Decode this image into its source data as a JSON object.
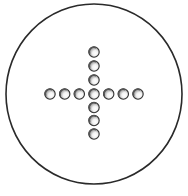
{
  "figure": {
    "description": "Circular field containing a cross of beads",
    "outline": {
      "cx": 94,
      "cy": 94,
      "rx": 88,
      "ry": 90,
      "stroke": "#2a2a2a",
      "stroke_width": 1.6
    },
    "bead_style": {
      "r": 5.2,
      "stroke": "#333333",
      "fill": "#ffffff",
      "shade": "#555555",
      "highlight": "#ffffff"
    },
    "cross": {
      "center": {
        "x": 94,
        "y": 94
      },
      "horizontal_count": 7,
      "vertical_count": 7,
      "spacing": 14.8
    },
    "beads": [
      {
        "id": "h1",
        "x": 50,
        "y": 94
      },
      {
        "id": "h2",
        "x": 64.7,
        "y": 94
      },
      {
        "id": "h3",
        "x": 79.3,
        "y": 94
      },
      {
        "id": "c",
        "x": 94,
        "y": 94
      },
      {
        "id": "h5",
        "x": 108.7,
        "y": 94
      },
      {
        "id": "h6",
        "x": 123.3,
        "y": 94
      },
      {
        "id": "h7",
        "x": 138,
        "y": 94
      },
      {
        "id": "v1",
        "x": 94,
        "y": 52
      },
      {
        "id": "v2",
        "x": 94,
        "y": 66
      },
      {
        "id": "v3",
        "x": 94,
        "y": 80
      },
      {
        "id": "v5",
        "x": 94,
        "y": 107.5
      },
      {
        "id": "v6",
        "x": 94,
        "y": 120.5
      },
      {
        "id": "v7",
        "x": 94,
        "y": 134
      }
    ]
  }
}
